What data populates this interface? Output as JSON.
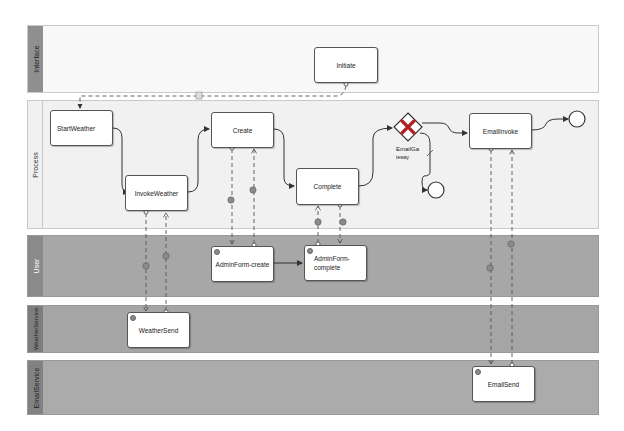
{
  "lanes": [
    {
      "id": "interface",
      "label": "Interface"
    },
    {
      "id": "process",
      "label": "Process"
    },
    {
      "id": "user",
      "label": "User"
    },
    {
      "id": "weather_service",
      "label": "WeatherService"
    },
    {
      "id": "email_service",
      "label": "EmailService"
    }
  ],
  "tasks": {
    "initiate": "Initiate",
    "start_weather": "StartWeather",
    "invoke_weather": "InvokeWeather",
    "create": "Create",
    "complete": "Complete",
    "email_invoke": "EmailInvoke",
    "admin_form_create": "AdminForm-create",
    "admin_form_complete": "AdminForm-\ncomplete",
    "weather_send": "WeatherSend",
    "email_send": "EmailSend"
  },
  "gateway": {
    "type": "exclusive",
    "label": "EmailGateway",
    "label_line1": "EmailGa",
    "label_line2": "teway"
  },
  "colors": {
    "interface_lane": "#f7f7f7",
    "process_lane": "#f2f2f2",
    "service_lane": "#a9a9a9",
    "lane_label_dark": "#8c8c8c",
    "gateway_mark": "#b22222"
  }
}
